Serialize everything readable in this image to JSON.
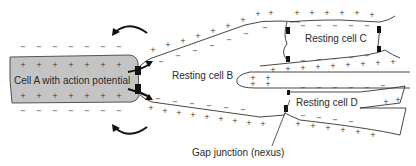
{
  "labels": {
    "cell_a": "Cell A with action potential",
    "cell_b": "Resting cell B",
    "cell_c": "Resting cell C",
    "cell_d": "Resting cell D",
    "gap_junction": "Gap junction (nexus)"
  },
  "signs": {
    "plus": "+",
    "minus": "−"
  },
  "colors": {
    "cell_a_fill": "#c4c4c4",
    "stroke": "#333333",
    "junction": "#111111"
  }
}
